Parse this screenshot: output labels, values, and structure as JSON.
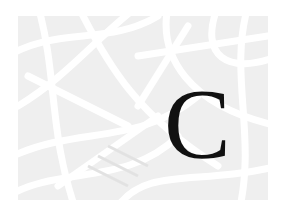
{
  "image": {
    "letter": "C",
    "colors": {
      "background": "#ffffff",
      "panel": "#efefef",
      "strokes": "#dcdcdc",
      "letter": "#111111"
    }
  }
}
